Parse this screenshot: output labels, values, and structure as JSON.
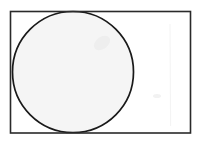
{
  "document": {
    "kind": "scanned-geometry-figure",
    "title": "Circle inscribed in rectangle",
    "background_color": "#ffffff",
    "width": 198,
    "height": 144
  },
  "figure": {
    "caption": "",
    "rectangle": {
      "name": "bounding-rectangle",
      "x": 10.5,
      "y": 11.5,
      "width": 180,
      "height": 121.5,
      "stroke_color": "#2a2a2a",
      "stroke_width": 1.6,
      "fill": "none"
    },
    "circle": {
      "name": "inscribed-circle",
      "cx": 73,
      "cy": 72,
      "r": 60.5,
      "stroke_color": "#1a1a1a",
      "stroke_width": 1.7,
      "fill_color": "#f5f5f5"
    },
    "artifacts": [
      {
        "name": "scan-smudge-upper-right",
        "cx": 102,
        "cy": 43,
        "rx": 9,
        "ry": 6,
        "rotate": -35,
        "color": "#eeeeee"
      },
      {
        "name": "scan-smudge-lower-left",
        "cx": 52,
        "cy": 98,
        "rx": 11,
        "ry": 5,
        "rotate": 20,
        "color": "#f1f1f1"
      },
      {
        "name": "scan-line-right-panel",
        "x1": 170,
        "y1": 24,
        "x2": 170.6,
        "y2": 126,
        "color": "#f4f4f4"
      },
      {
        "name": "scan-speck-right-panel",
        "cx": 157,
        "cy": 96,
        "rx": 4,
        "ry": 2,
        "rotate": 0,
        "color": "#f2f2f2"
      }
    ]
  },
  "colors": {
    "page": "#ffffff",
    "ink": "#1a1a1a",
    "rule": "#2a2a2a",
    "circle_fill": "#f5f5f5"
  }
}
